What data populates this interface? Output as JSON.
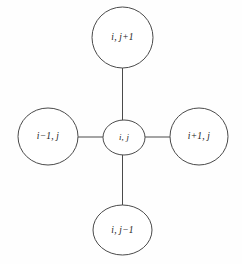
{
  "diagram": {
    "type": "five-point-stencil",
    "background_color": "#fefefe",
    "stroke_color": "#4a4a4a",
    "label_color": "#1b1b1b",
    "nodes": [
      {
        "id": "north",
        "label": "i, j+1",
        "cx": 122.5,
        "cy": 37.5,
        "rx": 30.5,
        "ry": 30.5
      },
      {
        "id": "west",
        "label": "i−1, j",
        "cx": 48,
        "cy": 136.5,
        "rx": 30,
        "ry": 28.5
      },
      {
        "id": "center",
        "label": "i, j",
        "cx": 124,
        "cy": 137.5,
        "rx": 21,
        "ry": 17.5
      },
      {
        "id": "east",
        "label": "i+1, j",
        "cx": 199,
        "cy": 136.5,
        "rx": 29,
        "ry": 28.5
      },
      {
        "id": "south",
        "label": "i, j−1",
        "cx": 122.5,
        "cy": 230,
        "rx": 29.5,
        "ry": 25
      }
    ],
    "edges": [
      {
        "id": "center-north",
        "from": "center",
        "to": "north",
        "x1": 122.5,
        "y1": 120,
        "x2": 122.5,
        "y2": 68
      },
      {
        "id": "center-west",
        "from": "center",
        "to": "west",
        "x1": 103,
        "y1": 137,
        "x2": 78,
        "y2": 137
      },
      {
        "id": "center-east",
        "from": "center",
        "to": "east",
        "x1": 145,
        "y1": 137,
        "x2": 170,
        "y2": 137
      },
      {
        "id": "center-south",
        "from": "center",
        "to": "south",
        "x1": 122.5,
        "y1": 155,
        "x2": 122.5,
        "y2": 205
      }
    ]
  }
}
